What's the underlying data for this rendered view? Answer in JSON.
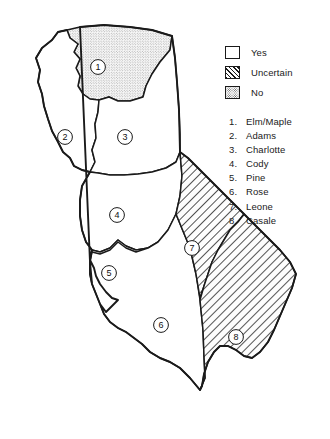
{
  "figure": {
    "type": "thematic-map"
  },
  "legend": {
    "items": [
      {
        "label": "Yes",
        "pattern": "plain",
        "swatch_name": "legend-swatch-yes"
      },
      {
        "label": "Uncertain",
        "pattern": "hatch",
        "swatch_name": "legend-swatch-uncertain"
      },
      {
        "label": "No",
        "pattern": "stipple",
        "swatch_name": "legend-swatch-no"
      }
    ]
  },
  "key_list": {
    "items": [
      {
        "number": "1.",
        "name": "Elm/Maple"
      },
      {
        "number": "2.",
        "name": "Adams"
      },
      {
        "number": "3.",
        "name": "Charlotte"
      },
      {
        "number": "4.",
        "name": "Cody"
      },
      {
        "number": "5.",
        "name": "Pine"
      },
      {
        "number": "6.",
        "name": "Rose"
      },
      {
        "number": "7.",
        "name": "Leone"
      },
      {
        "number": "8.",
        "name": "Casale"
      }
    ]
  },
  "map": {
    "regions": [
      {
        "id": "1",
        "name": "Elm/Maple",
        "fill": "stipple",
        "label_x": 98,
        "label_y": 67
      },
      {
        "id": "2",
        "name": "Adams",
        "fill": "plain",
        "label_x": 65,
        "label_y": 137
      },
      {
        "id": "3",
        "name": "Charlotte",
        "fill": "plain",
        "label_x": 125,
        "label_y": 137
      },
      {
        "id": "4",
        "name": "Cody",
        "fill": "plain",
        "label_x": 117,
        "label_y": 215
      },
      {
        "id": "5",
        "name": "Pine",
        "fill": "plain",
        "label_x": 109,
        "label_y": 273
      },
      {
        "id": "6",
        "name": "Rose",
        "fill": "plain",
        "label_x": 161,
        "label_y": 325
      },
      {
        "id": "7",
        "name": "Leone",
        "fill": "hatch",
        "label_x": 192,
        "label_y": 248
      },
      {
        "id": "8",
        "name": "Casale",
        "fill": "hatch",
        "label_x": 236,
        "label_y": 337
      }
    ]
  },
  "colors": {
    "ink": "#1a1a1a",
    "paper": "#ffffff",
    "stipple_dot": "#555555"
  }
}
